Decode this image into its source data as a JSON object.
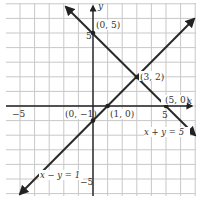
{
  "chart_data": {
    "type": "line",
    "title": "",
    "xlabel": "x",
    "ylabel": "y",
    "xlim": [
      -6,
      7
    ],
    "ylim": [
      -6,
      7
    ],
    "grid": true,
    "x_ticks": [
      {
        "value": -5,
        "label": "−5"
      },
      {
        "value": 5,
        "label": "5"
      }
    ],
    "y_ticks": [
      {
        "value": 5,
        "label": "5"
      },
      {
        "value": -5,
        "label": "−5"
      }
    ],
    "series": [
      {
        "name": "x + y = 5",
        "equation": "x + y = 5",
        "points": [
          [
            -1.8,
            6.8
          ],
          [
            7,
            -2
          ]
        ],
        "label_pos": [
          3.4,
          -1.7
        ]
      },
      {
        "name": "x − y = 1",
        "equation": "x − y = 1",
        "points": [
          [
            -5,
            -6
          ],
          [
            6.9,
            5.9
          ]
        ],
        "label_pos": [
          -4.4,
          -4.7
        ]
      }
    ],
    "points": [
      {
        "x": 0,
        "y": 5,
        "label": "(0, 5)"
      },
      {
        "x": 3,
        "y": 2,
        "label": "(3, 2)"
      },
      {
        "x": 5,
        "y": 0,
        "label": "(5, 0)"
      },
      {
        "x": 1,
        "y": 0,
        "label": "(1, 0)"
      },
      {
        "x": 0,
        "y": -1,
        "label": "(0, −1)"
      }
    ]
  },
  "labels": {
    "x_axis": "x",
    "y_axis": "y",
    "tick_x_neg5": "−5",
    "tick_x_5": "5",
    "tick_y_5": "5",
    "tick_y_neg5": "−5",
    "pt_0_5": "(0, 5)",
    "pt_3_2": "(3, 2)",
    "pt_5_0": "(5, 0)",
    "pt_1_0": "(1, 0)",
    "pt_0_neg1": "(0, −1)",
    "eq_sum": "x + y = 5",
    "eq_diff": "x − y = 1"
  },
  "colors": {
    "grid": "#c8c8c8",
    "axis": "#222222",
    "line": "#2a2a2a",
    "background": "#ffffff"
  }
}
